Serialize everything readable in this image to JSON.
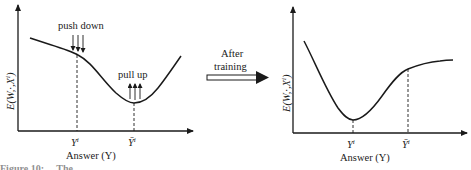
{
  "figure": {
    "transition_label_line1": "After",
    "transition_label_line2": "training",
    "caption_fragment": "Figure 10: ... The ..."
  },
  "left_panel": {
    "y_axis_label": "E(W, ·, X^i)",
    "y_axis_label_display": "E(W,·,Xⁱ)",
    "x_axis_label": "Answer (Y)",
    "tick_y_correct": "Yⁱ",
    "tick_y_bar": "Ȳⁱ",
    "annotation_push": "push down",
    "annotation_pull": "pull up"
  },
  "right_panel": {
    "y_axis_label": "E(W, ·, X^i)",
    "y_axis_label_display": "E(W,·,Xⁱ)",
    "x_axis_label": "Answer (Y)",
    "tick_y_correct": "Yⁱ",
    "tick_y_bar": "Ȳⁱ"
  },
  "colors": {
    "ink": "#1a1a1a",
    "background": "#ffffff"
  }
}
